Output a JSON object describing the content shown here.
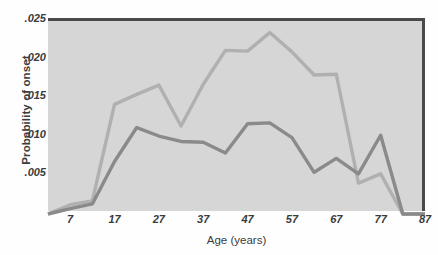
{
  "chart_data": {
    "type": "line",
    "title": "",
    "xlabel": "Age (years)",
    "ylabel": "Probability of onset",
    "xlim": [
      2,
      87
    ],
    "ylim": [
      0,
      0.025
    ],
    "grid": false,
    "legend_position": "none",
    "x_tick_labels": [
      ".025",
      ".020",
      ".015",
      ".010",
      ".005"
    ],
    "y_tick_labels": [
      ".025",
      ".020",
      ".015",
      ".010",
      ".005"
    ],
    "y_tick_values": [
      0.025,
      0.02,
      0.015,
      0.01,
      0.005
    ],
    "x_tick_labels_axis": [
      "7",
      "17",
      "27",
      "37",
      "47",
      "57",
      "67",
      "77",
      "87"
    ],
    "x_tick_values": [
      7,
      17,
      27,
      37,
      47,
      57,
      67,
      77,
      87
    ],
    "x": [
      2,
      7,
      12,
      17,
      22,
      27,
      32,
      37,
      42,
      47,
      52,
      57,
      62,
      67,
      72,
      77,
      82,
      87
    ],
    "series": [
      {
        "name": "series-light",
        "color": "#b0b0b0",
        "values": [
          0.0,
          0.0012,
          0.0017,
          0.0142,
          0.0155,
          0.0167,
          0.0114,
          0.0168,
          0.0212,
          0.0211,
          0.0235,
          0.021,
          0.018,
          0.0181,
          0.004,
          0.0052,
          0.0,
          0.0
        ]
      },
      {
        "name": "series-dark",
        "color": "#8a8a8a",
        "values": [
          0.0,
          0.0007,
          0.0013,
          0.0068,
          0.0112,
          0.0101,
          0.0094,
          0.0093,
          0.0079,
          0.0117,
          0.0118,
          0.0099,
          0.0054,
          0.0072,
          0.0052,
          0.0102,
          0.0,
          0.0
        ]
      }
    ],
    "colors": {
      "plot_background": "#d6d6d6",
      "axis_frame": "#4a4a4a",
      "text": "#3b3b3b",
      "series_light": "#b0b0b0",
      "series_dark": "#8a8a8a"
    }
  }
}
